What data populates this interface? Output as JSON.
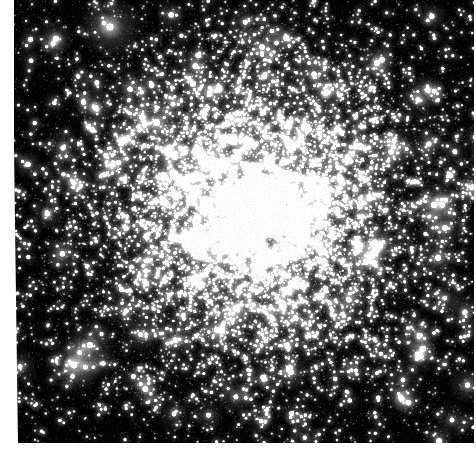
{
  "image": {
    "type": "astronomical-photograph",
    "subject": "globular star cluster",
    "color_mode": "grayscale",
    "width_px": 476,
    "height_px": 455,
    "alt_text": "Dense globular star cluster filling the frame, thousands of unresolved white stars concentrating toward a bright diffuse core slightly right of center, fading into a sparse black sky at the corners."
  },
  "plate": {
    "left_px": 14,
    "top_px": 0,
    "width_px": 462,
    "height_px": 443,
    "background_color": "#000000",
    "page_margin_color": "#ffffff",
    "left_margin_px": 14,
    "bottom_margin_px": 12,
    "right_margin_px": 2
  },
  "cluster": {
    "center_x_px": 241,
    "center_y_px": 210,
    "core_radius_px": 52,
    "halo_radius_px": 215,
    "core_glow_color": "#b4b4b4",
    "halo_glow_color": "#2a2a2a",
    "star_color": "#ffffff",
    "total_stars": 22000,
    "bright_star_count": 150,
    "field_star_count": 3000,
    "noise_amplitude": 0.1
  },
  "chart_data": {
    "type": "scatter",
    "title": "",
    "xlabel": "",
    "ylabel": "",
    "radial_profile": {
      "radius_px": [
        0,
        20,
        40,
        60,
        80,
        100,
        120,
        140,
        160,
        180,
        200,
        230,
        260
      ],
      "relative_density": [
        1.0,
        0.94,
        0.81,
        0.65,
        0.5,
        0.38,
        0.28,
        0.21,
        0.15,
        0.11,
        0.08,
        0.05,
        0.03
      ],
      "relative_brightness": [
        1.0,
        0.9,
        0.74,
        0.56,
        0.41,
        0.29,
        0.2,
        0.14,
        0.09,
        0.06,
        0.04,
        0.02,
        0.01
      ]
    }
  }
}
